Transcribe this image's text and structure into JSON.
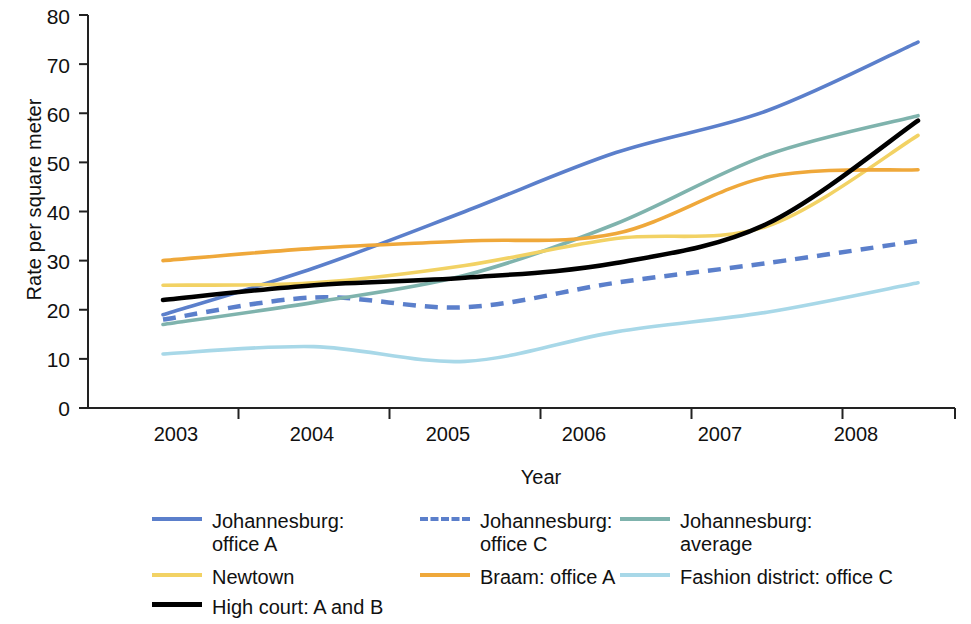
{
  "chart_data": {
    "type": "line",
    "title": "",
    "xlabel": "Year",
    "ylabel": "Rate per square meter",
    "categories": [
      "2003",
      "2004",
      "2005",
      "2006",
      "2007",
      "2008"
    ],
    "x": [
      2003,
      2004,
      2005,
      2006,
      2007,
      2008
    ],
    "xlim": [
      2003,
      2008
    ],
    "ylim": [
      0,
      80
    ],
    "yticks": [
      0,
      10,
      20,
      30,
      40,
      50,
      60,
      70,
      80
    ],
    "xticks": [
      "2003",
      "2004",
      "2005",
      "2006",
      "2007",
      "2008"
    ],
    "grid": false,
    "legend_position": "bottom",
    "series": [
      {
        "name": "Johannesburg: office A",
        "label": "Johannesburg:\noffice A",
        "color": "#5B7FCB",
        "style": "solid",
        "values": [
          19.0,
          28.5,
          40.0,
          52.0,
          60.5,
          74.5
        ]
      },
      {
        "name": "Johannesburg: office C",
        "label": "Johannesburg:\noffice C",
        "color": "#5B7FCB",
        "style": "dashed",
        "values": [
          18.0,
          22.5,
          20.5,
          25.5,
          29.5,
          34.0
        ]
      },
      {
        "name": "Johannesburg: average",
        "label": "Johannesburg:\naverage",
        "color": "#7FB3AD",
        "style": "solid",
        "values": [
          17.0,
          21.5,
          27.0,
          37.5,
          51.5,
          59.5
        ]
      },
      {
        "name": "Newtown",
        "label": "Newtown",
        "color": "#F2D264",
        "style": "solid",
        "values": [
          25.0,
          25.5,
          29.0,
          34.5,
          37.0,
          55.5
        ]
      },
      {
        "name": "Braam: office A",
        "label": "Braam: office A",
        "color": "#EFA83A",
        "style": "solid",
        "values": [
          30.0,
          32.5,
          34.0,
          35.5,
          47.0,
          48.5
        ]
      },
      {
        "name": "Fashion district: office C",
        "label": "Fashion district: office C",
        "color": "#A8D8E8",
        "style": "solid",
        "values": [
          11.0,
          12.5,
          9.5,
          15.5,
          19.5,
          25.5
        ]
      },
      {
        "name": "High court: A and B",
        "label": "High court: A and B",
        "color": "#000000",
        "style": "solid",
        "values": [
          22.0,
          25.0,
          26.5,
          29.5,
          37.5,
          58.5
        ]
      }
    ]
  },
  "axis": {
    "y_title": "Rate per square meter",
    "x_title": "Year",
    "y_labels": [
      "80",
      "70",
      "60",
      "50",
      "40",
      "30",
      "20",
      "10",
      "0"
    ],
    "x_labels": [
      "2003",
      "2004",
      "2005",
      "2006",
      "2007",
      "2008"
    ]
  },
  "legend": {
    "items": [
      {
        "label": "Johannesburg:\noffice A",
        "color": "#5B7FCB",
        "style": "solid"
      },
      {
        "label": "Johannesburg:\noffice C",
        "color": "#5B7FCB",
        "style": "dashed"
      },
      {
        "label": "Johannesburg:\naverage",
        "color": "#7FB3AD",
        "style": "solid"
      },
      {
        "label": "Newtown",
        "color": "#F2D264",
        "style": "solid"
      },
      {
        "label": "Braam: office A",
        "color": "#EFA83A",
        "style": "solid"
      },
      {
        "label": "Fashion district: office C",
        "color": "#A8D8E8",
        "style": "solid"
      },
      {
        "label": "High court: A and B",
        "color": "#000000",
        "style": "solid"
      }
    ]
  }
}
